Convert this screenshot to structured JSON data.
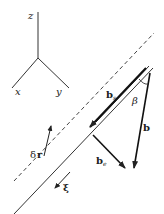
{
  "diagram": {
    "type": "dislocation vector geometry",
    "axes": {
      "z_label": "z",
      "x_label": "x",
      "y_label": "y"
    },
    "vectors": {
      "b": "b",
      "b_s": "b",
      "b_s_sub": "s",
      "b_e": "b",
      "b_e_sub": "e",
      "delta_r": "δ",
      "delta_r_r": "r",
      "xi": "ξ"
    },
    "angle_label": "β",
    "colors": {
      "ink": "#222222",
      "background": "#ffffff"
    }
  }
}
